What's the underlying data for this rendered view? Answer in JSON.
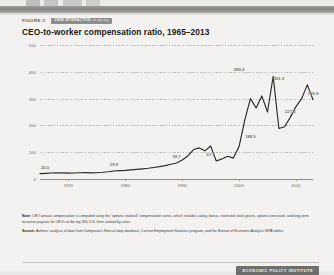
{
  "figure": {
    "label": "FIGURE C",
    "badge_strong": "VIEW INTERACTIVE",
    "badge_soft": "on epi.org",
    "title": "CEO-to-worker compensation ratio, 1965–2013"
  },
  "notes": {
    "note_lead": "Note:",
    "note_text": " CEO annual compensation is computed using the “options realized” compensation series, which includes salary, bonus, restricted stock grants, options exercised, and long-term incentive payouts for CEOs at the top 350 U.S. firms ranked by sales.",
    "source_lead": "Source:",
    "source_text": " Authors’ analysis of data from Compustat’s ExecuComp database, Current Employment Statistics program, and the Bureau of Economic Analysis NIPA tables."
  },
  "footer": {
    "logo": "ECONOMIC POLICY INSTITUTE"
  },
  "colors": {
    "line": "#2b2b29",
    "grid": "#b9b9b7",
    "text": "#3a3a38",
    "badge": "#8d8d8d",
    "sheet": "#f3f2f0"
  },
  "chart_data": {
    "type": "line",
    "title": "CEO-to-worker compensation ratio, 1965–2013",
    "xlabel": "",
    "ylabel": "",
    "xlim": [
      1965,
      2013
    ],
    "ylim": [
      0,
      500
    ],
    "yticks": [
      0,
      100,
      200,
      300,
      400,
      500
    ],
    "ytick_labels": [
      "0",
      "100",
      "200",
      "300",
      "400",
      "500"
    ],
    "xticks": [
      1970,
      1980,
      1990,
      2000,
      2010
    ],
    "xtick_labels": [
      "1970",
      "1980",
      "1990",
      "2000",
      "2010"
    ],
    "grid": true,
    "legend": "none",
    "series": [
      {
        "name": "CEO-to-worker compensation ratio",
        "x": [
          1965,
          1966,
          1967,
          1968,
          1969,
          1970,
          1971,
          1972,
          1973,
          1974,
          1975,
          1976,
          1977,
          1978,
          1979,
          1980,
          1981,
          1982,
          1983,
          1984,
          1985,
          1986,
          1987,
          1988,
          1989,
          1990,
          1991,
          1992,
          1993,
          1994,
          1995,
          1996,
          1997,
          1998,
          1999,
          2000,
          2001,
          2002,
          2003,
          2004,
          2005,
          2006,
          2007,
          2008,
          2009,
          2010,
          2011,
          2012,
          2013
        ],
        "values": [
          20.0,
          21.2,
          22.4,
          23.5,
          23.0,
          22.0,
          22.5,
          23.5,
          24.0,
          23.0,
          23.5,
          25.0,
          27.0,
          29.9,
          31.0,
          32.0,
          34.0,
          36.0,
          38.0,
          40.0,
          43.0,
          46.0,
          50.0,
          55.0,
          59.7,
          71.2,
          86.0,
          110.0,
          116.0,
          105.0,
          123.0,
          67.3,
          75.0,
          85.0,
          78.0,
          121.0,
          220.0,
          300.0,
          265.0,
          310.0,
          250.0,
          383.4,
          188.5,
          195.0,
          230.0,
          270.0,
          300.0,
          351.3,
          295.9
        ],
        "color": "#2b2b29"
      }
    ],
    "point_labels": [
      {
        "x": 1965,
        "value": 20.0,
        "text": "20.0"
      },
      {
        "x": 1978,
        "value": 29.9,
        "text": "29.9"
      },
      {
        "x": 1989,
        "value": 59.7,
        "text": "59.7"
      },
      {
        "x": 1995,
        "value": 67.3,
        "text": "67.3"
      },
      {
        "x": 2000,
        "value": 383.4,
        "text": "383.4"
      },
      {
        "x": 2002,
        "value": 188.5,
        "text": "188.5"
      },
      {
        "x": 2007,
        "value": 351.3,
        "text": "351.3"
      },
      {
        "x": 2009,
        "value": 227.6,
        "text": "227.6"
      },
      {
        "x": 2013,
        "value": 295.9,
        "text": "295.9"
      }
    ]
  }
}
